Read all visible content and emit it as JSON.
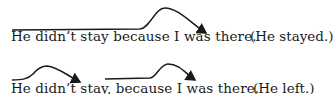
{
  "examples": [
    {
      "sentence": "He didn’t stay because I was there.",
      "gloss": "(He stayed.)",
      "intonation": "single rise-fall contour over whole sentence"
    },
    {
      "sentence": "He didn’t stay, because I was there.",
      "gloss": "(He left.)",
      "intonation": "two separate rise-fall contours"
    }
  ]
}
